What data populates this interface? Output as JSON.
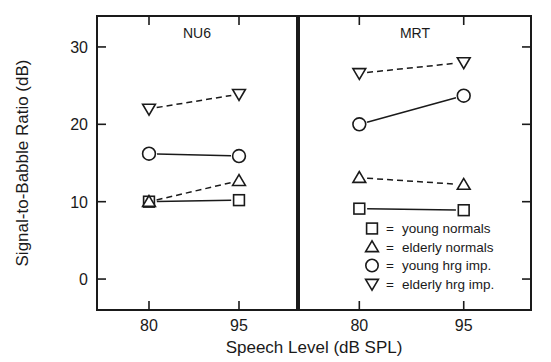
{
  "chart_data": {
    "type": "line",
    "title": "",
    "xlabel": "Speech Level (dB SPL)",
    "ylabel": "Signal-to-Babble Ratio (dB)",
    "x": [
      80,
      95
    ],
    "xtick_labels": [
      "80",
      "95"
    ],
    "ytick_labels": [
      "0",
      "10",
      "20",
      "30"
    ],
    "yticks": [
      0,
      10,
      20,
      30
    ],
    "ylim": [
      -4,
      34
    ],
    "xlim": [
      72,
      103
    ],
    "grid": false,
    "legend_position": "bottom-right-inside-panel-2",
    "panels": [
      {
        "name": "NU6",
        "label": "NU6",
        "series": [
          {
            "name": "young normals",
            "marker": "square",
            "line": "solid",
            "values": [
              10.0,
              10.2
            ]
          },
          {
            "name": "elderly normals",
            "marker": "triangle-up",
            "line": "dashed",
            "values": [
              10.0,
              12.7
            ]
          },
          {
            "name": "young hrg imp.",
            "marker": "circle",
            "line": "solid",
            "values": [
              16.2,
              15.9
            ]
          },
          {
            "name": "elderly hrg imp.",
            "marker": "triangle-down",
            "line": "dashed",
            "values": [
              22.0,
              23.9
            ]
          }
        ]
      },
      {
        "name": "MRT",
        "label": "MRT",
        "series": [
          {
            "name": "young normals",
            "marker": "square",
            "line": "solid",
            "values": [
              9.1,
              8.9
            ]
          },
          {
            "name": "elderly normals",
            "marker": "triangle-up",
            "line": "dashed",
            "values": [
              13.1,
              12.2
            ]
          },
          {
            "name": "young hrg imp.",
            "marker": "circle",
            "line": "solid",
            "values": [
              20.0,
              23.7
            ]
          },
          {
            "name": "elderly hrg imp.",
            "marker": "triangle-down",
            "line": "dashed",
            "values": [
              26.6,
              28.0
            ]
          }
        ]
      }
    ],
    "legend": [
      {
        "marker": "square",
        "equals": "=",
        "label": "young normals"
      },
      {
        "marker": "triangle-up",
        "equals": "=",
        "label": "elderly normals"
      },
      {
        "marker": "circle",
        "equals": "=",
        "label": "young hrg imp."
      },
      {
        "marker": "triangle-down",
        "equals": "=",
        "label": "elderly hrg imp."
      }
    ],
    "colors": {
      "ink": "#1a1a1a",
      "background": "#ffffff"
    }
  }
}
